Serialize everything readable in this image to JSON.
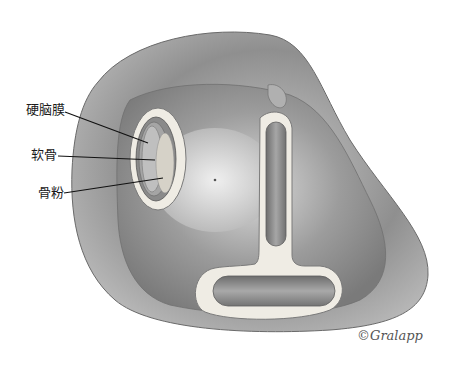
{
  "figure": {
    "type": "surgical illustration"
  },
  "labels": [
    {
      "text": "硬脑膜",
      "x": 26,
      "y": 103
    },
    {
      "text": "软骨",
      "x": 31,
      "y": 148
    },
    {
      "text": "骨粉",
      "x": 38,
      "y": 186
    }
  ],
  "signature": "©Gralapp",
  "colors": {
    "background": "#ffffff",
    "tissue_dark": "#6e6e6e",
    "tissue_mid": "#9a9a9a",
    "tissue_light": "#d8d8d8",
    "bone_rim": "#efece4",
    "leader_line": "#111111"
  }
}
